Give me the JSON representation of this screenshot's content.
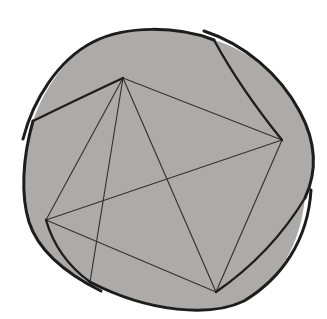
{
  "figure": {
    "viewbox": "0 0 327 319",
    "colors": {
      "background": "#ffffff",
      "disc_fill": "#acabaa",
      "outline": "#1d1d1d",
      "flap_edge": "#1e1e1e",
      "chord": "#333333"
    },
    "stroke_widths": {
      "rim": 3.0,
      "flap_edge": 2.4,
      "chord": 1.15
    },
    "points": {
      "T": [
        123,
        78
      ],
      "R": [
        282,
        140
      ],
      "B": [
        216,
        292
      ],
      "BL": [
        46,
        220
      ],
      "nL": [
        33,
        121
      ],
      "nTR": [
        214,
        40
      ],
      "nR": [
        305,
        198
      ],
      "nBL": [
        90,
        282
      ]
    },
    "silhouette": "M 33,121 C 42,95 62,58 95,41 C 127,25 180,27 214,40 C 248,50 282,76 301,113 C 315,140 317,170 305,198 C 300,245 280,280 243,301 C 211,317 150,313 90,282 C 60,268 38,250 29,222 C 21,196 22,160 33,121 Z",
    "rim_arcs": [
      {
        "name": "rim-arc-top",
        "d": "M 23,139 C 33,100 58,60 93,42 C 126,25 178,26 214,40"
      },
      {
        "name": "rim-arc-right",
        "d": "M 204,31 C 244,44 280,74 300,112 C 315,140 318,170 305,198"
      },
      {
        "name": "rim-arc-bottom",
        "d": "M 311,190 C 308,240 282,278 244,301 C 211,317 150,313 90,282"
      },
      {
        "name": "rim-arc-left",
        "d": "M 101,291 C 63,272 38,250 29,222 C 21,196 22,160 33,121"
      }
    ],
    "flap_edges": [
      {
        "name": "flap-edge-left-to-top",
        "d": "M 33,121 Q 76,100 123,78"
      },
      {
        "name": "flap-edge-topright-to-right",
        "d": "M 214,40 Q 240,88 282,140"
      },
      {
        "name": "flap-edge-right-to-bottom",
        "d": "M 305,198 Q 271,254 216,292"
      },
      {
        "name": "flap-edge-bottomleft-to-left",
        "d": "M 90,282 Q 57,258 46,220"
      }
    ],
    "chords": [
      {
        "name": "chord-top-right",
        "from": "T",
        "to": "R"
      },
      {
        "name": "chord-right-bottom",
        "from": "R",
        "to": "B"
      },
      {
        "name": "chord-bottom-left",
        "from": "B",
        "to": "BL"
      },
      {
        "name": "chord-left-top",
        "from": "BL",
        "to": "T"
      },
      {
        "name": "diagonal-top-bottom",
        "from": "T",
        "to": "B"
      },
      {
        "name": "diagonal-left-right",
        "from": "BL",
        "to": "R"
      },
      {
        "name": "crease-top-to-bottomleft-notch",
        "from": "T",
        "to": "nBL"
      }
    ]
  }
}
